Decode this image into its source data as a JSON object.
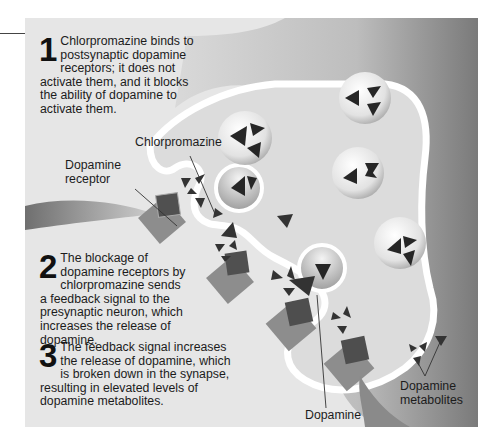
{
  "figure": {
    "steps": [
      {
        "number": "1",
        "text": "Chlorpromazine binds to postsynaptic dopamine receptors; it does not activate them, and it blocks the ability of dopamine to activate them."
      },
      {
        "number": "2",
        "text": "The blockage of dopamine receptors by chlorpromazine sends a feedback signal to the presynaptic neuron, which increases the release of dopamine."
      },
      {
        "number": "3",
        "text": "The feedback signal increases the release of dopamine, which is broken down in the synapse, resulting in elevated levels of dopamine metabolites."
      }
    ],
    "labels": {
      "chlorpromazine": "Chlorpromazine",
      "dopamine_receptor_line1": "Dopamine",
      "dopamine_receptor_line2": "receptor",
      "dopamine": "Dopamine",
      "metabolites_line1": "Dopamine",
      "metabolites_line2": "metabolites"
    },
    "colors": {
      "background": "#e6e6e6",
      "receptor": "#8a8a8a",
      "drug": "#4a4a4a",
      "molecule": "#2a2a2a"
    }
  }
}
